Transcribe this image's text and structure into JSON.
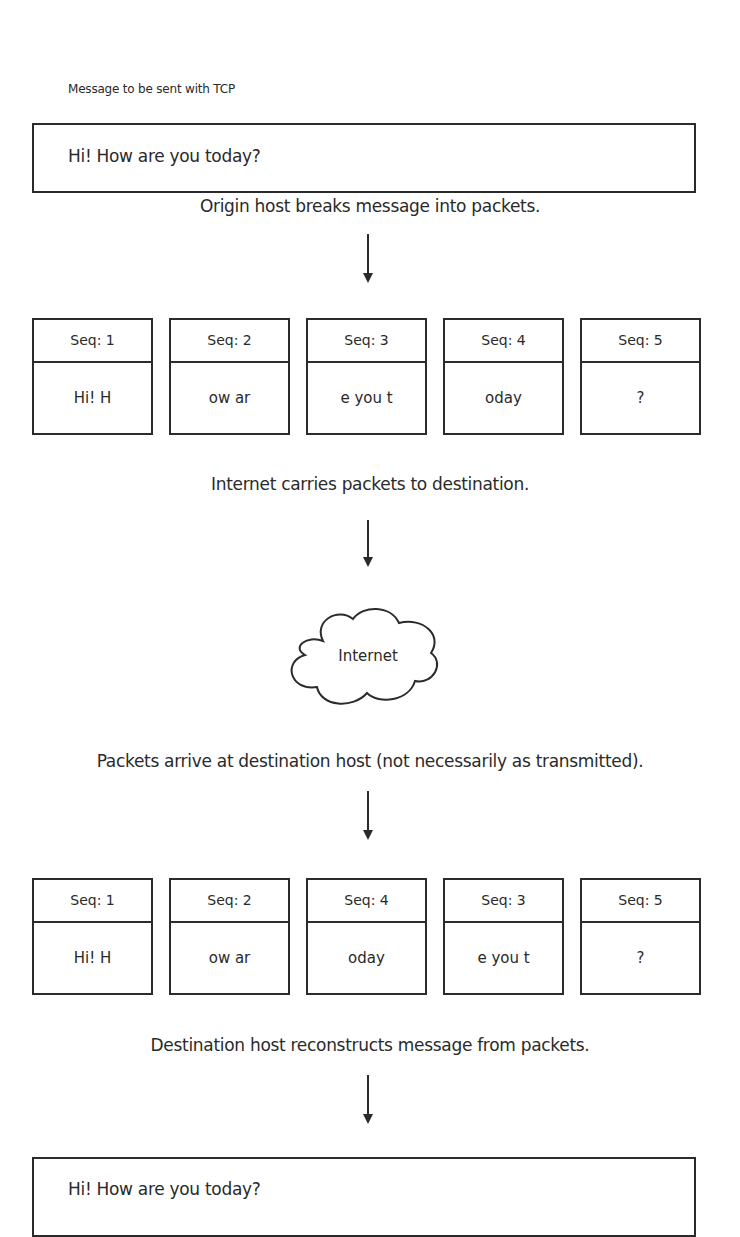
{
  "source_message": {
    "label": "Message to be sent with TCP",
    "text": "Hi! How are you today?"
  },
  "steps": [
    {
      "caption": "Origin host breaks message into packets."
    },
    {
      "caption": "Internet carries packets to destination."
    },
    {
      "caption": "Packets arrive at destination host (not necessarily as transmitted)."
    },
    {
      "caption": "Destination host reconstructs message from packets."
    }
  ],
  "sent_packets": [
    {
      "seq": "Seq: 1",
      "payload": "Hi! H"
    },
    {
      "seq": "Seq: 2",
      "payload": "ow ar"
    },
    {
      "seq": "Seq: 3",
      "payload": "e you t"
    },
    {
      "seq": "Seq: 4",
      "payload": "oday"
    },
    {
      "seq": "Seq: 5",
      "payload": "?"
    }
  ],
  "network": {
    "label": "Internet",
    "icon": "cloud-icon"
  },
  "received_packets": [
    {
      "seq": "Seq: 1",
      "payload": "Hi! H"
    },
    {
      "seq": "Seq: 2",
      "payload": "ow ar"
    },
    {
      "seq": "Seq: 4",
      "payload": "oday"
    },
    {
      "seq": "Seq: 3",
      "payload": "e you t"
    },
    {
      "seq": "Seq: 5",
      "payload": "?"
    }
  ],
  "reconstructed_message": {
    "text": "Hi! How are you today?"
  },
  "colors": {
    "stroke": "#2b2b2b",
    "text": "#2a2a2a",
    "background": "#ffffff"
  }
}
